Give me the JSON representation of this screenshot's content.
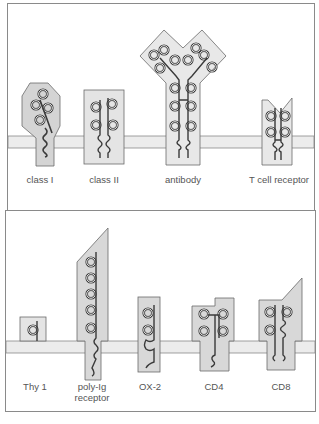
{
  "colors": {
    "panel_border": "#8a8a8a",
    "membrane_fill": "#ececec",
    "membrane_stroke": "#8a8a8a",
    "domain_fill": "#dcdcdc",
    "domain_stroke": "#6a6a6a",
    "chain_stroke": "#3a3a3a",
    "label_text": "#555555"
  },
  "top_panel": {
    "molecules": [
      {
        "id": "class-i",
        "label": "class I"
      },
      {
        "id": "class-ii",
        "label": "class II"
      },
      {
        "id": "antibody",
        "label": "antibody"
      },
      {
        "id": "t-cell-receptor",
        "label": "T cell receptor"
      }
    ]
  },
  "bottom_panel": {
    "molecules": [
      {
        "id": "thy1",
        "label": "Thy 1"
      },
      {
        "id": "poly-ig-receptor",
        "label_line1": "poly-Ig",
        "label_line2": "receptor"
      },
      {
        "id": "ox2",
        "label": "OX-2"
      },
      {
        "id": "cd4",
        "label": "CD4"
      },
      {
        "id": "cd8",
        "label": "CD8"
      }
    ]
  }
}
